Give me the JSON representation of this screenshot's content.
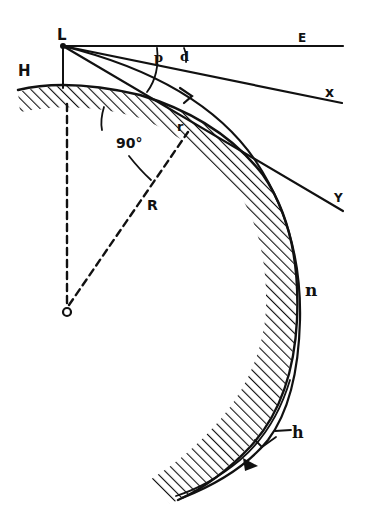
{
  "diagram": {
    "colors": {
      "ink": "#111111",
      "background": "#ffffff"
    },
    "labels": {
      "L": "L",
      "E": "E",
      "X": "x",
      "Y": "Y",
      "H": "H",
      "p": "p",
      "d": "d",
      "P": "P",
      "r": "r",
      "angle": "90°",
      "R": "R",
      "O": "O",
      "n": "n",
      "h": "h"
    },
    "elements": [
      {
        "id": "observer-point",
        "label": "L",
        "desc": "observer point at height H"
      },
      {
        "id": "horizontal-line",
        "label": "E",
        "desc": "true horizontal from L"
      },
      {
        "id": "sight-line-x",
        "label": "x",
        "desc": "straight line of sight"
      },
      {
        "id": "tangent-line-y",
        "label": "Y",
        "desc": "tangent line to earth surface"
      },
      {
        "id": "refracted-ray",
        "label": "n",
        "desc": "curved refracted light path with arrow"
      },
      {
        "id": "earth-surface",
        "desc": "hatched curved earth surface"
      },
      {
        "id": "earth-radius",
        "label": "R",
        "desc": "dashed radius from center O to tangent point r"
      },
      {
        "id": "right-angle",
        "label": "90°",
        "desc": "angle between radius and tangent"
      },
      {
        "id": "height-marker",
        "label": "h",
        "desc": "height of ray above surface"
      }
    ]
  }
}
